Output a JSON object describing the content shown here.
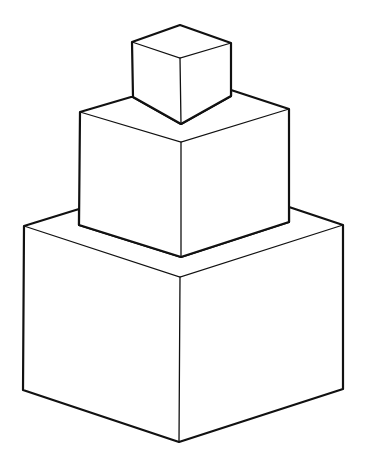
{
  "figure": {
    "background": "#ffffff",
    "stroke_color": "#111111",
    "cubes": [
      {
        "name": "bottom",
        "outline": "24,226 79,209 79,225 181,257 289,222 289,207 343,225 343,389 179,442 23,390",
        "inner": [
          "24,226 180,277 343,225",
          "180,277 179,442"
        ]
      },
      {
        "name": "middle",
        "outline": "80,112 131,97 133,97 181,124 231,96 231,90 289,109 289,222 181,257 79,225",
        "inner": [
          "80,112 181,142 289,109",
          "181,142 181,257"
        ]
      },
      {
        "name": "top",
        "outline": "132,42 180,25 231,43 231,96 181,124 133,97",
        "inner": [
          "132,42 180,58 231,43",
          "180,58 181,124"
        ]
      }
    ]
  }
}
